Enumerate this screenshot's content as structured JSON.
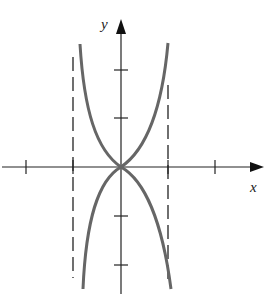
{
  "diagram": {
    "type": "function graph",
    "axes": {
      "x_label": "x",
      "y_label": "y"
    },
    "x_ticks": 4,
    "y_ticks": 4,
    "asymptotes": "two vertical dashed lines",
    "curves": "two curves tangent at origin, one opening up, one opening down, bounded by asymptotes",
    "curve_color": "#666666",
    "axis_color": "#222222"
  }
}
